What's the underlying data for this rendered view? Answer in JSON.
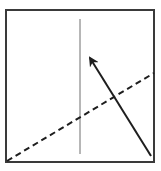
{
  "diagram": {
    "canvas": {
      "width": 161,
      "height": 171,
      "background": "#ffffff"
    },
    "box": {
      "x": 6,
      "y": 10,
      "width": 148,
      "height": 152,
      "stroke": "#3a3a3a",
      "stroke_width": 2
    },
    "vertical_line": {
      "x1": 80,
      "y1": 19,
      "x2": 80,
      "y2": 154,
      "stroke": "#6e6e6e",
      "stroke_width": 1
    },
    "dashed_line": {
      "x1": 7,
      "y1": 161,
      "x2": 154,
      "y2": 73,
      "stroke": "#1e1e1e",
      "stroke_width": 2,
      "dasharray": "6,4"
    },
    "arrow": {
      "x1": 151,
      "y1": 156,
      "x2": 90,
      "y2": 58,
      "stroke": "#1e1e1e",
      "stroke_width": 2,
      "head": "filled-triangle"
    }
  }
}
